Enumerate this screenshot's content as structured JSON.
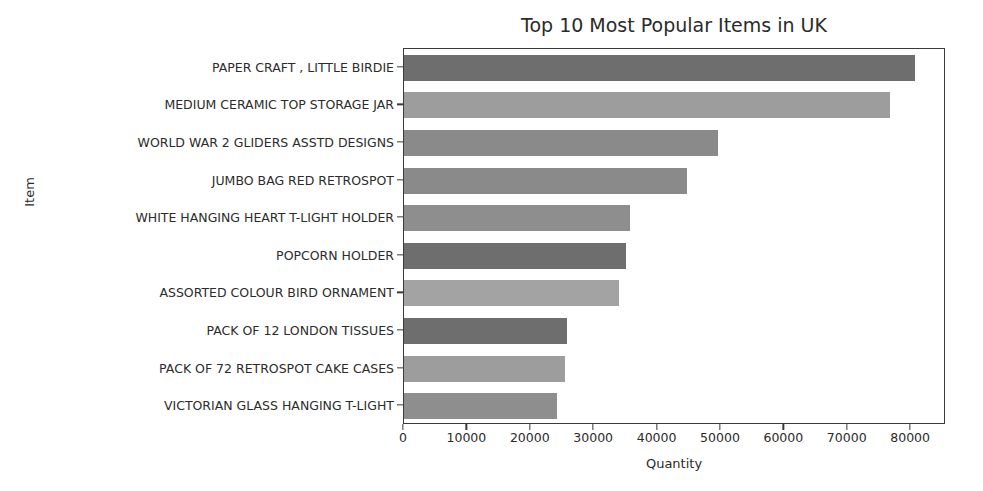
{
  "chart_data": {
    "type": "bar",
    "orientation": "horizontal",
    "title": "Top 10 Most Popular Items in UK",
    "xlabel": "Quantity",
    "ylabel": "Item",
    "grid": false,
    "legend": null,
    "xlim": [
      0,
      85500
    ],
    "xticks": [
      0,
      10000,
      20000,
      30000,
      40000,
      50000,
      60000,
      70000,
      80000
    ],
    "xticklabels": [
      "0",
      "10000",
      "20000",
      "30000",
      "40000",
      "50000",
      "60000",
      "70000",
      "80000"
    ],
    "categories": [
      "PAPER CRAFT , LITTLE BIRDIE",
      "MEDIUM CERAMIC TOP STORAGE JAR",
      "WORLD WAR 2 GLIDERS ASSTD DESIGNS",
      "JUMBO BAG RED RETROSPOT",
      "WHITE HANGING HEART T-LIGHT HOLDER",
      "POPCORN HOLDER",
      "ASSORTED COLOUR BIRD ORNAMENT",
      "PACK OF 12 LONDON TISSUES",
      "PACK OF 72 RETROSPOT CAKE CASES",
      "VICTORIAN GLASS HANGING T-LIGHT"
    ],
    "values": [
      80600,
      76700,
      49600,
      44700,
      35650,
      35000,
      33900,
      25700,
      25400,
      24100
    ],
    "bar_colors": [
      "#6e6e6e",
      "#9d9d9d",
      "#8a8a8a",
      "#8a8a8a",
      "#8e8e8e",
      "#6e6e6e",
      "#a3a3a3",
      "#6e6e6e",
      "#9d9d9d",
      "#8e8e8e"
    ]
  },
  "axes": {
    "spine_color": "#3a3a3a",
    "text_color": "#2b2b2b"
  }
}
